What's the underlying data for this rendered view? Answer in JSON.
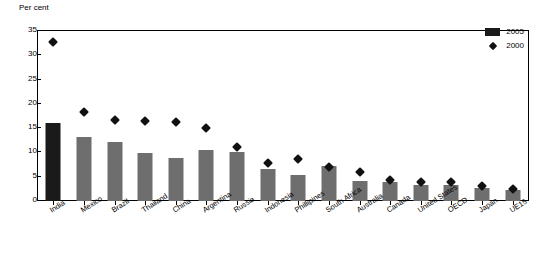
{
  "chart_data": {
    "type": "bar",
    "title": "",
    "subtitle": "",
    "xlabel": "",
    "ylabel": "Per cent",
    "ylim": [
      0,
      35
    ],
    "yticks": [
      0,
      5,
      10,
      15,
      20,
      25,
      30,
      35
    ],
    "grid": false,
    "legend_position": "top-right",
    "categories": [
      "India",
      "Mexico",
      "Brazil",
      "Thailand",
      "China",
      "Argentina",
      "Russia",
      "Indonesia",
      "Phillipines",
      "South Africa",
      "Australia",
      "Canada",
      "United States",
      "OECD",
      "Japan",
      "UE15"
    ],
    "series": [
      {
        "name": "2005",
        "type": "bar",
        "color": "#6e6e6e",
        "highlight_index": 0,
        "highlight_color": "#1a1a1a",
        "values": [
          16.0,
          13.2,
          12.2,
          9.9,
          8.9,
          10.6,
          10.0,
          6.6,
          5.3,
          7.3,
          4.2,
          3.9,
          3.3,
          3.3,
          2.7,
          2.3
        ]
      },
      {
        "name": "2000",
        "type": "scatter",
        "marker": "diamond",
        "color": "#111111",
        "values": [
          32.7,
          18.3,
          16.6,
          16.4,
          16.2,
          15.1,
          11.2,
          7.9,
          8.7,
          7.0,
          5.9,
          4.4,
          3.9,
          3.9,
          3.0,
          2.5
        ]
      }
    ]
  },
  "legend": {
    "items": [
      {
        "label": "2005",
        "marker": "bar",
        "color": "#1a1a1a"
      },
      {
        "label": "2000",
        "marker": "diamond",
        "color": "#111111"
      }
    ]
  }
}
